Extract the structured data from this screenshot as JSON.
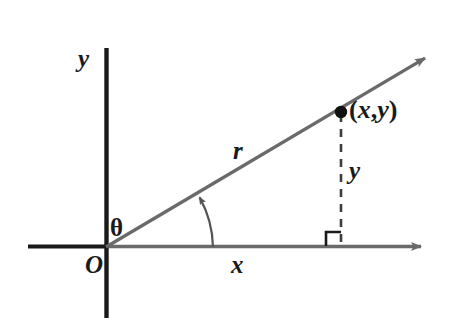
{
  "figure": {
    "colors": {
      "axis_black": "#1a1a1a",
      "ray_gray": "#6a6a6a",
      "dash_gray": "#4a4a4a",
      "background": "#ffffff",
      "label_color": "#1a1a1a"
    },
    "labels": {
      "y_axis": "y",
      "x_axis": "x",
      "origin": "O",
      "theta": "θ",
      "radius": "r",
      "side_y": "y",
      "point_open_paren": "(",
      "point_x": "x",
      "point_comma": ",",
      "point_y": "y",
      "point_close_paren": ")"
    },
    "geometry": {
      "origin": {
        "x": 106,
        "y": 247
      },
      "y_axis": {
        "x": 106,
        "top": 48,
        "bottom": 318
      },
      "x_axis_negative": {
        "from_x": 28,
        "to_x": 106,
        "y": 247
      },
      "x_axis_positive": {
        "from_x": 106,
        "to_x": 428,
        "y": 247
      },
      "ray": {
        "from_x": 106,
        "from_y": 247,
        "to_x": 432,
        "to_y": 54
      },
      "point": {
        "x": 341,
        "y": 112
      },
      "dashed_drop": {
        "x": 341,
        "from_y": 112,
        "to_y": 247
      },
      "right_angle_marker": {
        "size": 15,
        "corner_x": 341,
        "corner_y": 247,
        "opens": "left"
      },
      "angle_arc": {
        "radius": 107,
        "start_x": 213,
        "start_y": 247,
        "end_x": 198,
        "end_y": 196
      }
    }
  }
}
